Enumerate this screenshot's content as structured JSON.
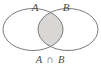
{
  "figure": {
    "name": "venn-diagram-intersection",
    "background_color": "#ffffff",
    "width": 101,
    "height": 68
  },
  "diagram": {
    "type": "venn",
    "stroke_color": "#6b6b6b",
    "stroke_width": 0.9,
    "shade_color": "#d9d7d5",
    "shade_region": "intersection",
    "circles": [
      {
        "set": "A",
        "label": "A",
        "cx": 33,
        "cy": 29.5,
        "rx": 30,
        "ry": 21,
        "fill": "none"
      },
      {
        "set": "B",
        "label": "B",
        "cx": 68,
        "cy": 29.5,
        "rx": 30,
        "ry": 21,
        "fill": "none"
      }
    ],
    "labels": {
      "set_a": "A",
      "set_b": "B"
    },
    "label_positions": {
      "set_a": {
        "x": 35,
        "y": 8
      },
      "set_b": {
        "x": 66,
        "y": 8
      }
    }
  },
  "caption": {
    "full_text": "A ∩ B",
    "left_operand": "A",
    "operator": "∩",
    "right_operand": "B",
    "x": 50,
    "y": 61
  }
}
